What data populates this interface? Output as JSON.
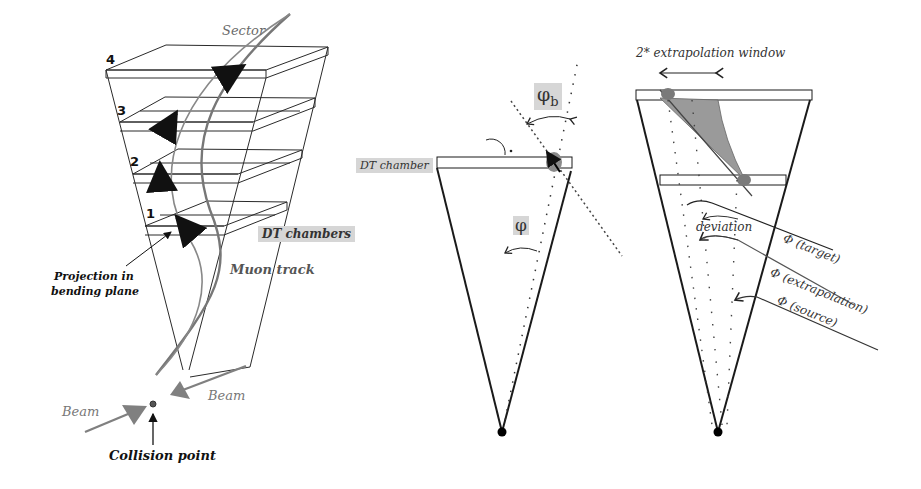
{
  "figure": {
    "panels": [
      {
        "id": "sector-3d",
        "labels": {
          "sector": "Sector",
          "stations": [
            "1",
            "2",
            "3",
            "4"
          ],
          "dt_chambers": "DT chambers",
          "muon_track": "Muon track",
          "projection": [
            "Projection in",
            "bending plane"
          ],
          "beam_left": "Beam",
          "beam_right": "Beam",
          "collision_point": "Collision point"
        }
      },
      {
        "id": "bending-angle",
        "labels": {
          "dt_chamber": "DT chamber",
          "phi_b": "φ",
          "phi_b_sub": "b",
          "phi": "φ"
        }
      },
      {
        "id": "extrapolation",
        "labels": {
          "window": "2* extrapolation window",
          "deviation": "deviation",
          "phi_target": "Φ (target)",
          "phi_extrapolation": "Φ (extrapolation)",
          "phi_source": "Φ (source)"
        }
      }
    ],
    "colors": {
      "line": "#1a1a1a",
      "track": "#7a7a7a",
      "beam": "#808080",
      "shade": "#9a9a9a",
      "label_bg": "#d6d6d6"
    }
  }
}
